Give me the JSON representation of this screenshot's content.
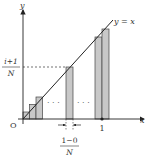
{
  "diagram": {
    "type": "riemann-sum-illustration",
    "axes": {
      "x_label": "x",
      "y_label": "y",
      "origin_label": "O",
      "x_tick_label": "1"
    },
    "line": {
      "label": "y = x",
      "color": "#222222"
    },
    "bars": {
      "fill": "#c8c8c8",
      "stroke": "#444444",
      "count_shown": 6
    },
    "y_marker": {
      "numerator": "i+1",
      "denominator": "N"
    },
    "width_marker": {
      "numerator": "1−0",
      "denominator": "N"
    },
    "ellipsis": "· · ·"
  }
}
